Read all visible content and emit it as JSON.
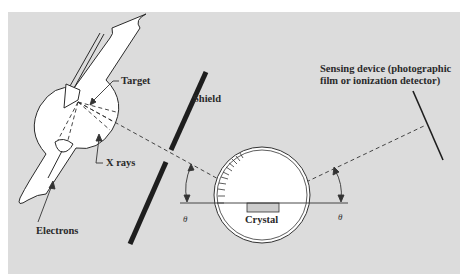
{
  "figure": {
    "background": "#dcdcdc",
    "labels": {
      "target": "Target",
      "x_rays": "X rays",
      "electrons": "Electrons",
      "shield": "Shield",
      "crystal": "Crystal",
      "sensing_line1": "Sensing device (photographic",
      "sensing_line2": "film or ionization detector)",
      "theta_left": "θ",
      "theta_right": "θ"
    },
    "components": [
      "x-ray tube",
      "shield",
      "crystal goniometer",
      "sensing device"
    ]
  }
}
